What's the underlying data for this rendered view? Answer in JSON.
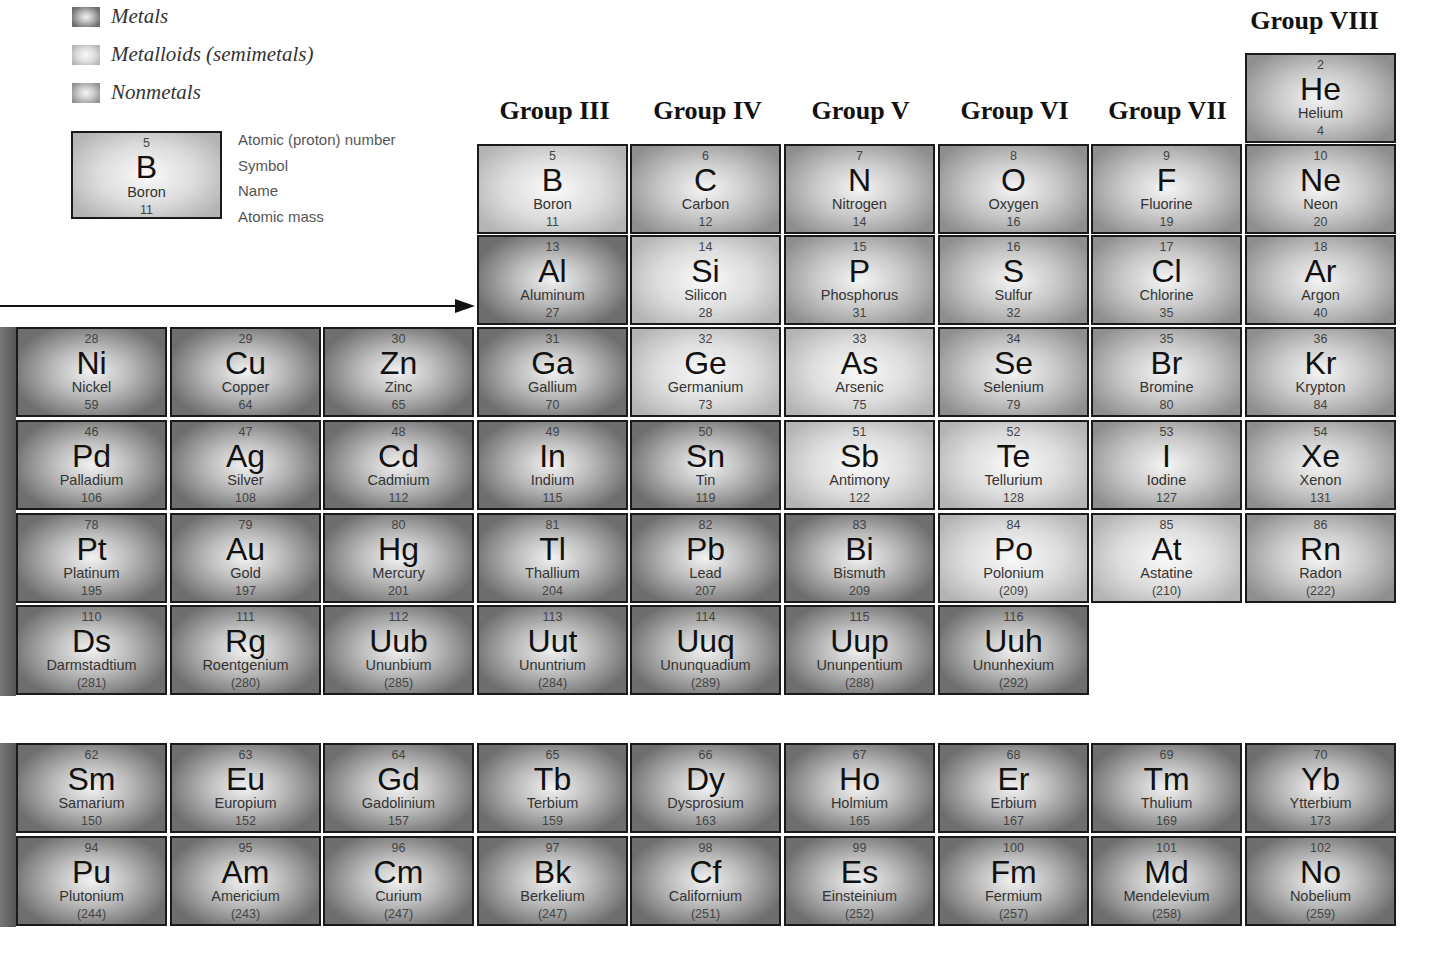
{
  "legend": {
    "items": [
      {
        "label": "Metals",
        "class": "metal",
        "color": "#6e6e6e"
      },
      {
        "label": "Metalloids (semimetals)",
        "class": "metalloid",
        "color": "#c8c8c8"
      },
      {
        "label": "Nonmetals",
        "class": "nonmetal",
        "color": "#9a9a9a"
      }
    ],
    "key": {
      "number": "5",
      "symbol": "B",
      "name": "Boron",
      "mass": "11",
      "lines": [
        "Atomic (proton) number",
        "Symbol",
        "Name",
        "Atomic mass"
      ]
    }
  },
  "groups": [
    {
      "label": "Group III",
      "x": 478,
      "y": 96
    },
    {
      "label": "Group IV",
      "x": 631,
      "y": 96
    },
    {
      "label": "Group V",
      "x": 784,
      "y": 96
    },
    {
      "label": "Group VI",
      "x": 938,
      "y": 96
    },
    {
      "label": "Group VII",
      "x": 1091,
      "y": 96
    },
    {
      "label": "Group VIII",
      "x": 1238,
      "y": 6
    }
  ],
  "elements": [
    {
      "n": "2",
      "s": "He",
      "name": "Helium",
      "m": "4",
      "t": "nonmetal",
      "col": 8,
      "y": 53
    },
    {
      "n": "5",
      "s": "B",
      "name": "Boron",
      "m": "11",
      "t": "metalloid",
      "col": 3,
      "y": 144
    },
    {
      "n": "6",
      "s": "C",
      "name": "Carbon",
      "m": "12",
      "t": "nonmetal",
      "col": 4,
      "y": 144
    },
    {
      "n": "7",
      "s": "N",
      "name": "Nitrogen",
      "m": "14",
      "t": "nonmetal",
      "col": 5,
      "y": 144
    },
    {
      "n": "8",
      "s": "O",
      "name": "Oxygen",
      "m": "16",
      "t": "nonmetal",
      "col": 6,
      "y": 144
    },
    {
      "n": "9",
      "s": "F",
      "name": "Fluorine",
      "m": "19",
      "t": "nonmetal",
      "col": 7,
      "y": 144
    },
    {
      "n": "10",
      "s": "Ne",
      "name": "Neon",
      "m": "20",
      "t": "nonmetal",
      "col": 8,
      "y": 144
    },
    {
      "n": "13",
      "s": "Al",
      "name": "Aluminum",
      "m": "27",
      "t": "metal",
      "col": 3,
      "y": 235
    },
    {
      "n": "14",
      "s": "Si",
      "name": "Silicon",
      "m": "28",
      "t": "metalloid",
      "col": 4,
      "y": 235
    },
    {
      "n": "15",
      "s": "P",
      "name": "Phosphorus",
      "m": "31",
      "t": "nonmetal",
      "col": 5,
      "y": 235
    },
    {
      "n": "16",
      "s": "S",
      "name": "Sulfur",
      "m": "32",
      "t": "nonmetal",
      "col": 6,
      "y": 235
    },
    {
      "n": "17",
      "s": "Cl",
      "name": "Chlorine",
      "m": "35",
      "t": "nonmetal",
      "col": 7,
      "y": 235
    },
    {
      "n": "18",
      "s": "Ar",
      "name": "Argon",
      "m": "40",
      "t": "nonmetal",
      "col": 8,
      "y": 235
    },
    {
      "n": "28",
      "s": "Ni",
      "name": "Nickel",
      "m": "59",
      "t": "metal",
      "col": 0,
      "y": 327
    },
    {
      "n": "29",
      "s": "Cu",
      "name": "Copper",
      "m": "64",
      "t": "metal",
      "col": 1,
      "y": 327
    },
    {
      "n": "30",
      "s": "Zn",
      "name": "Zinc",
      "m": "65",
      "t": "metal",
      "col": 2,
      "y": 327
    },
    {
      "n": "31",
      "s": "Ga",
      "name": "Gallium",
      "m": "70",
      "t": "metal",
      "col": 3,
      "y": 327
    },
    {
      "n": "32",
      "s": "Ge",
      "name": "Germanium",
      "m": "73",
      "t": "metalloid",
      "col": 4,
      "y": 327
    },
    {
      "n": "33",
      "s": "As",
      "name": "Arsenic",
      "m": "75",
      "t": "metalloid",
      "col": 5,
      "y": 327
    },
    {
      "n": "34",
      "s": "Se",
      "name": "Selenium",
      "m": "79",
      "t": "nonmetal",
      "col": 6,
      "y": 327
    },
    {
      "n": "35",
      "s": "Br",
      "name": "Bromine",
      "m": "80",
      "t": "nonmetal",
      "col": 7,
      "y": 327
    },
    {
      "n": "36",
      "s": "Kr",
      "name": "Krypton",
      "m": "84",
      "t": "nonmetal",
      "col": 8,
      "y": 327
    },
    {
      "n": "46",
      "s": "Pd",
      "name": "Palladium",
      "m": "106",
      "t": "metal",
      "col": 0,
      "y": 420
    },
    {
      "n": "47",
      "s": "Ag",
      "name": "Silver",
      "m": "108",
      "t": "metal",
      "col": 1,
      "y": 420
    },
    {
      "n": "48",
      "s": "Cd",
      "name": "Cadmium",
      "m": "112",
      "t": "metal",
      "col": 2,
      "y": 420
    },
    {
      "n": "49",
      "s": "In",
      "name": "Indium",
      "m": "115",
      "t": "metal",
      "col": 3,
      "y": 420
    },
    {
      "n": "50",
      "s": "Sn",
      "name": "Tin",
      "m": "119",
      "t": "metal",
      "col": 4,
      "y": 420
    },
    {
      "n": "51",
      "s": "Sb",
      "name": "Antimony",
      "m": "122",
      "t": "metalloid",
      "col": 5,
      "y": 420
    },
    {
      "n": "52",
      "s": "Te",
      "name": "Tellurium",
      "m": "128",
      "t": "metalloid",
      "col": 6,
      "y": 420
    },
    {
      "n": "53",
      "s": "I",
      "name": "Iodine",
      "m": "127",
      "t": "nonmetal",
      "col": 7,
      "y": 420
    },
    {
      "n": "54",
      "s": "Xe",
      "name": "Xenon",
      "m": "131",
      "t": "nonmetal",
      "col": 8,
      "y": 420
    },
    {
      "n": "78",
      "s": "Pt",
      "name": "Platinum",
      "m": "195",
      "t": "metal",
      "col": 0,
      "y": 513
    },
    {
      "n": "79",
      "s": "Au",
      "name": "Gold",
      "m": "197",
      "t": "metal",
      "col": 1,
      "y": 513
    },
    {
      "n": "80",
      "s": "Hg",
      "name": "Mercury",
      "m": "201",
      "t": "metal",
      "col": 2,
      "y": 513
    },
    {
      "n": "81",
      "s": "Tl",
      "name": "Thallium",
      "m": "204",
      "t": "metal",
      "col": 3,
      "y": 513
    },
    {
      "n": "82",
      "s": "Pb",
      "name": "Lead",
      "m": "207",
      "t": "metal",
      "col": 4,
      "y": 513
    },
    {
      "n": "83",
      "s": "Bi",
      "name": "Bismuth",
      "m": "209",
      "t": "metal",
      "col": 5,
      "y": 513
    },
    {
      "n": "84",
      "s": "Po",
      "name": "Polonium",
      "m": "(209)",
      "t": "metalloid",
      "col": 6,
      "y": 513
    },
    {
      "n": "85",
      "s": "At",
      "name": "Astatine",
      "m": "(210)",
      "t": "metalloid",
      "col": 7,
      "y": 513
    },
    {
      "n": "86",
      "s": "Rn",
      "name": "Radon",
      "m": "(222)",
      "t": "nonmetal",
      "col": 8,
      "y": 513
    },
    {
      "n": "110",
      "s": "Ds",
      "name": "Darmstadtium",
      "m": "(281)",
      "t": "metal",
      "col": 0,
      "y": 605
    },
    {
      "n": "111",
      "s": "Rg",
      "name": "Roentgenium",
      "m": "(280)",
      "t": "metal",
      "col": 1,
      "y": 605
    },
    {
      "n": "112",
      "s": "Uub",
      "name": "Ununbium",
      "m": "(285)",
      "t": "metal",
      "col": 2,
      "y": 605
    },
    {
      "n": "113",
      "s": "Uut",
      "name": "Ununtrium",
      "m": "(284)",
      "t": "metal",
      "col": 3,
      "y": 605
    },
    {
      "n": "114",
      "s": "Uuq",
      "name": "Ununquadium",
      "m": "(289)",
      "t": "metal",
      "col": 4,
      "y": 605
    },
    {
      "n": "115",
      "s": "Uup",
      "name": "Ununpentium",
      "m": "(288)",
      "t": "metal",
      "col": 5,
      "y": 605
    },
    {
      "n": "116",
      "s": "Uuh",
      "name": "Ununhexium",
      "m": "(292)",
      "t": "metal",
      "col": 6,
      "y": 605
    },
    {
      "n": "62",
      "s": "Sm",
      "name": "Samarium",
      "m": "150",
      "t": "metal",
      "col": 0,
      "y": 743
    },
    {
      "n": "63",
      "s": "Eu",
      "name": "Europium",
      "m": "152",
      "t": "metal",
      "col": 1,
      "y": 743
    },
    {
      "n": "64",
      "s": "Gd",
      "name": "Gadolinium",
      "m": "157",
      "t": "metal",
      "col": 2,
      "y": 743
    },
    {
      "n": "65",
      "s": "Tb",
      "name": "Terbium",
      "m": "159",
      "t": "metal",
      "col": 3,
      "y": 743
    },
    {
      "n": "66",
      "s": "Dy",
      "name": "Dysprosium",
      "m": "163",
      "t": "metal",
      "col": 4,
      "y": 743
    },
    {
      "n": "67",
      "s": "Ho",
      "name": "Holmium",
      "m": "165",
      "t": "metal",
      "col": 5,
      "y": 743
    },
    {
      "n": "68",
      "s": "Er",
      "name": "Erbium",
      "m": "167",
      "t": "metal",
      "col": 6,
      "y": 743
    },
    {
      "n": "69",
      "s": "Tm",
      "name": "Thulium",
      "m": "169",
      "t": "metal",
      "col": 7,
      "y": 743
    },
    {
      "n": "70",
      "s": "Yb",
      "name": "Ytterbium",
      "m": "173",
      "t": "metal",
      "col": 8,
      "y": 743
    },
    {
      "n": "94",
      "s": "Pu",
      "name": "Plutonium",
      "m": "(244)",
      "t": "metal",
      "col": 0,
      "y": 836
    },
    {
      "n": "95",
      "s": "Am",
      "name": "Americium",
      "m": "(243)",
      "t": "metal",
      "col": 1,
      "y": 836
    },
    {
      "n": "96",
      "s": "Cm",
      "name": "Curium",
      "m": "(247)",
      "t": "metal",
      "col": 2,
      "y": 836
    },
    {
      "n": "97",
      "s": "Bk",
      "name": "Berkelium",
      "m": "(247)",
      "t": "metal",
      "col": 3,
      "y": 836
    },
    {
      "n": "98",
      "s": "Cf",
      "name": "Californium",
      "m": "(251)",
      "t": "metal",
      "col": 4,
      "y": 836
    },
    {
      "n": "99",
      "s": "Es",
      "name": "Einsteinium",
      "m": "(252)",
      "t": "metal",
      "col": 5,
      "y": 836
    },
    {
      "n": "100",
      "s": "Fm",
      "name": "Fermium",
      "m": "(257)",
      "t": "metal",
      "col": 6,
      "y": 836
    },
    {
      "n": "101",
      "s": "Md",
      "name": "Mendelevium",
      "m": "(258)",
      "t": "metal",
      "col": 7,
      "y": 836
    },
    {
      "n": "102",
      "s": "No",
      "name": "Nobelium",
      "m": "(259)",
      "t": "metal",
      "col": 8,
      "y": 836
    }
  ]
}
